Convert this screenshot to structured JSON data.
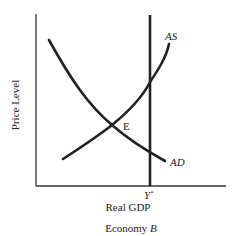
{
  "diagram": {
    "title": "Economy B",
    "title_prefix": "Economy ",
    "title_italic": "B",
    "x_axis_label": "Real GDP",
    "y_axis_label": "Price Level",
    "curves": [
      {
        "name": "AD",
        "label": "AD",
        "shape": "downward-sloping convex"
      },
      {
        "name": "AS",
        "label": "AS",
        "shape": "upward-sloping convex"
      }
    ],
    "vertical_line": {
      "label_main": "Y",
      "label_sup": "*"
    },
    "equilibrium": {
      "label": "E"
    },
    "colors": {
      "line": "#222222",
      "background": "#ffffff"
    }
  }
}
